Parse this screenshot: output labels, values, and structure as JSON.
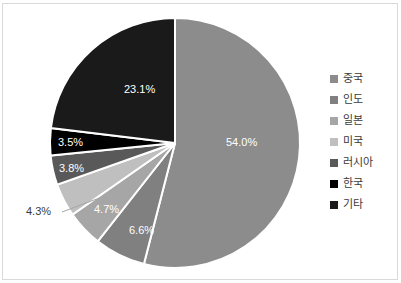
{
  "chart_data": {
    "type": "pie",
    "title": "",
    "categories": [
      "중국",
      "인도",
      "일본",
      "미국",
      "러시아",
      "한국",
      "기타"
    ],
    "values": [
      54.0,
      6.6,
      4.7,
      4.3,
      3.8,
      3.5,
      23.1
    ],
    "value_labels": [
      "54.0%",
      "6.6%",
      "4.7%",
      "4.3%",
      "3.8%",
      "3.5%",
      "23.1%"
    ],
    "colors": [
      "#8c8c8c",
      "#808080",
      "#a6a6a6",
      "#bfbfbf",
      "#595959",
      "#000000",
      "#1a1a1a"
    ],
    "legend_position": "right",
    "start_angle_deg": 0,
    "direction": "clockwise",
    "slice_border_color": "#ffffff",
    "label_text_color": "#ffffff",
    "outside_label_text_color": "#3a3a3a",
    "frame_border_color": "#d9d9d9",
    "background": "#ffffff"
  },
  "pie_geometry": {
    "cx": 175,
    "cy": 143,
    "r": 125
  },
  "slices": [
    {
      "name": "중국",
      "label": "54.0%",
      "color": "#8c8c8c",
      "label_x": 226,
      "label_y": 146,
      "label_outside": false
    },
    {
      "name": "인도",
      "label": "6.6%",
      "color": "#808080",
      "label_x": 129,
      "label_y": 234,
      "label_outside": false
    },
    {
      "name": "일본",
      "label": "4.7%",
      "color": "#a6a6a6",
      "label_x": 94,
      "label_y": 213,
      "label_outside": false
    },
    {
      "name": "미국",
      "label": "4.3%",
      "color": "#bfbfbf",
      "label_x": 26,
      "label_y": 215,
      "label_outside": true
    },
    {
      "name": "러시아",
      "label": "3.8%",
      "color": "#595959",
      "label_x": 59,
      "label_y": 172,
      "label_outside": false
    },
    {
      "name": "한국",
      "label": "3.5%",
      "color": "#000000",
      "label_x": 58,
      "label_y": 146,
      "label_outside": false
    },
    {
      "name": "기타",
      "label": "23.1%",
      "color": "#1a1a1a",
      "label_x": 124,
      "label_y": 93,
      "label_outside": false
    }
  ],
  "legend": {
    "items": [
      {
        "label": "중국",
        "color": "#8c8c8c"
      },
      {
        "label": "인도",
        "color": "#808080"
      },
      {
        "label": "일본",
        "color": "#a6a6a6"
      },
      {
        "label": "미국",
        "color": "#bfbfbf"
      },
      {
        "label": "러시아",
        "color": "#595959"
      },
      {
        "label": "한국",
        "color": "#000000"
      },
      {
        "label": "기타",
        "color": "#1a1a1a"
      }
    ]
  },
  "leader_line": {
    "x1": 62,
    "y1": 212,
    "x2": 102,
    "y2": 197
  }
}
